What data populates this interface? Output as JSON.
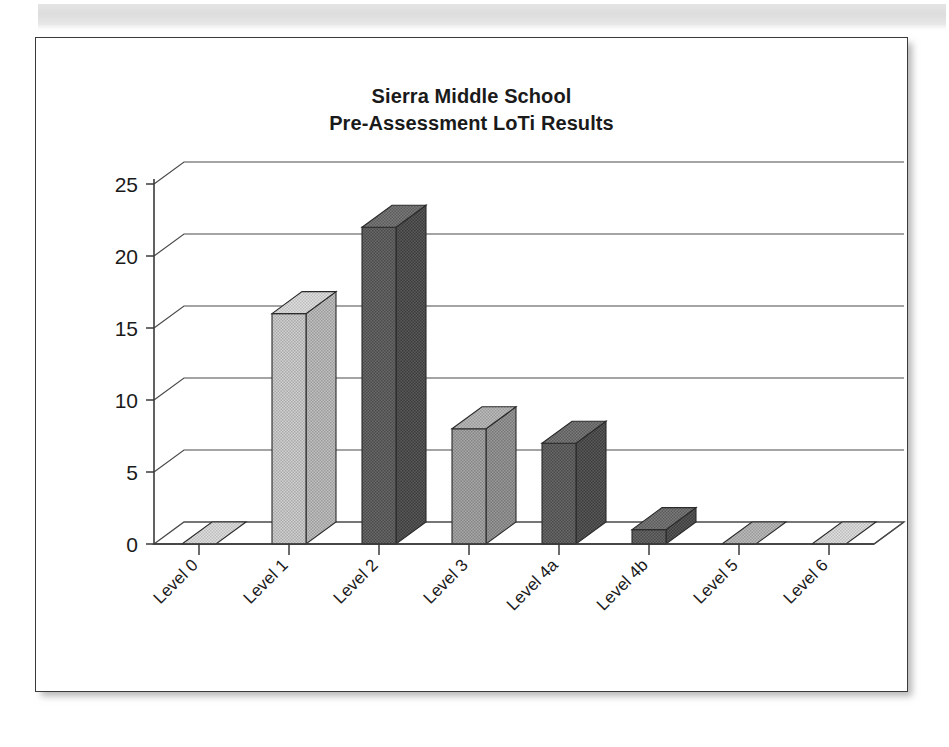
{
  "chart_data": {
    "type": "bar",
    "title": "Sierra Middle School\nPre-Assessment LoTi Results",
    "title_line1": "Sierra Middle School",
    "title_line2": "Pre-Assessment LoTi Results",
    "categories": [
      "Level 0",
      "Level 1",
      "Level 2",
      "Level 3",
      "Level 4a",
      "Level 4b",
      "Level 5",
      "Level 6"
    ],
    "values": [
      0,
      16,
      22,
      8,
      7,
      1,
      0,
      0
    ],
    "xlabel": "",
    "ylabel": "",
    "ylim": [
      0,
      25
    ],
    "ytick_labels": [
      "0",
      "5",
      "10",
      "15",
      "20",
      "25"
    ],
    "ytick_values": [
      0,
      5,
      10,
      15,
      20,
      25
    ],
    "grid": true,
    "legend": false,
    "style": "3d-column",
    "bar_colors": [
      "#b9b9b9",
      "#b0b0b0",
      "#5c5c5c",
      "#9a9a9a",
      "#6e6e6e",
      "#5c5c5c",
      "#a8a8a8",
      "#b9b9b9"
    ]
  },
  "colors": {
    "frame_border": "#3a3a3a",
    "text": "#1a1a1a",
    "grid": "#4a4a4a",
    "background": "#ffffff"
  }
}
